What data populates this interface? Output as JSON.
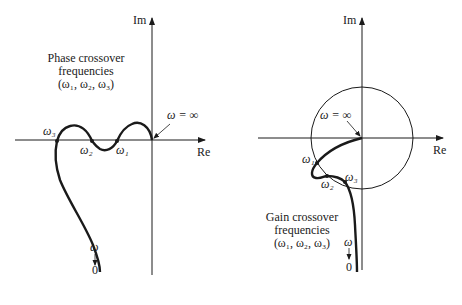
{
  "left_plot": {
    "axis_im_label": "Im",
    "axis_re_label": "Re",
    "omega_inf_label": "ω = ∞",
    "caption_lines": [
      "Phase crossover",
      "frequencies",
      "(ω₁, ω₂, ω₃)"
    ],
    "point_labels": {
      "w1": "ω₁",
      "w2": "ω₂",
      "w3": "ω₃"
    },
    "omega_label": "ω",
    "zero_label": "0"
  },
  "right_plot": {
    "axis_im_label": "Im",
    "axis_re_label": "Re",
    "omega_inf_label": "ω = ∞",
    "caption_lines": [
      "Gain crossover",
      "frequencies",
      "(ω₁, ω₂, ω₃)"
    ],
    "point_labels": {
      "w1": "ω₁",
      "w2": "ω₂",
      "w3": "ω₃"
    },
    "omega_label": "ω",
    "zero_label": "0"
  },
  "colors": {
    "ink": "#1a1a1a",
    "background": "#ffffff"
  }
}
